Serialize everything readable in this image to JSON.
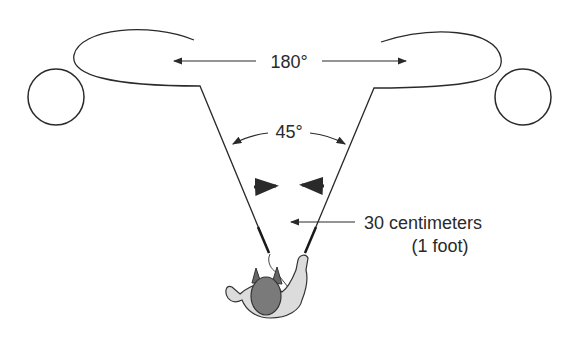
{
  "diagram": {
    "labels": {
      "sweep_angle": "180°",
      "spread_angle": "45°",
      "distance_line1": "30 centimeters",
      "distance_line2": "(1 foot)"
    },
    "elements": {
      "left_target": "circle",
      "right_target": "circle",
      "left_loop": "loop-path",
      "right_loop": "loop-path",
      "operator": "person-top-view"
    },
    "colors": {
      "line": "#2a2a2a",
      "body_light": "#d9d9d9",
      "head_dark": "#7a7a7a"
    }
  }
}
